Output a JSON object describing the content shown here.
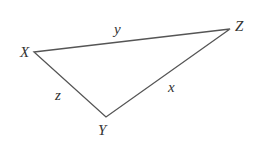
{
  "diagram": {
    "type": "triangle",
    "stroke_color": "#555555",
    "vertices": [
      {
        "name": "X",
        "x": 34,
        "y": 52,
        "label_x": 20,
        "label_y": 57
      },
      {
        "name": "Z",
        "x": 230,
        "y": 29,
        "label_x": 235,
        "label_y": 31
      },
      {
        "name": "Y",
        "x": 106,
        "y": 117,
        "label_x": 98,
        "label_y": 135
      }
    ],
    "sides": [
      {
        "name": "y",
        "between": [
          "X",
          "Z"
        ],
        "label_x": 114,
        "label_y": 34
      },
      {
        "name": "z",
        "between": [
          "X",
          "Y"
        ],
        "label_x": 55,
        "label_y": 100
      },
      {
        "name": "x",
        "between": [
          "Y",
          "Z"
        ],
        "label_x": 168,
        "label_y": 92
      }
    ]
  }
}
